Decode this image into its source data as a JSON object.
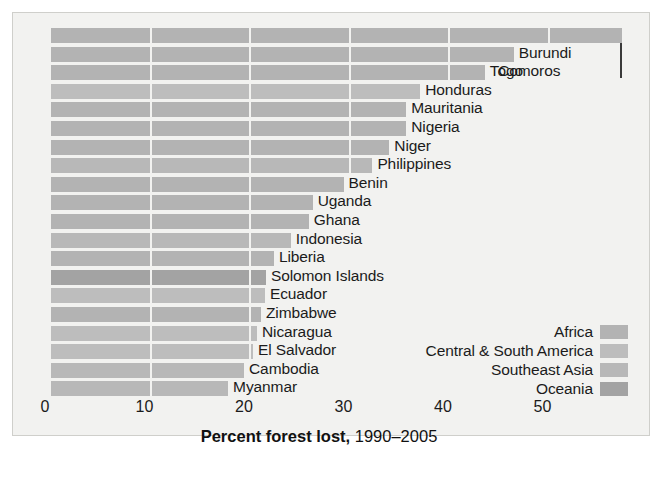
{
  "chart_data": {
    "type": "bar",
    "orientation": "horizontal",
    "title": "",
    "xlabel_bold": "Percent forest lost,",
    "xlabel_regular": " 1990–2005",
    "ylabel": "",
    "xlim": [
      0,
      58
    ],
    "xticks": [
      0,
      10,
      20,
      30,
      40,
      50
    ],
    "xtick_labels": [
      "0",
      "10",
      "20",
      "30",
      "40",
      "50"
    ],
    "grid": true,
    "legend_position": "inside-right",
    "categories": [
      "Comoros",
      "Burundi",
      "Togo",
      "Honduras",
      "Mauritania",
      "Nigeria",
      "Niger",
      "Philippines",
      "Benin",
      "Uganda",
      "Ghana",
      "Indonesia",
      "Liberia",
      "Solomon Islands",
      "Ecuador",
      "Zimbabwe",
      "Nicaragua",
      "El Salvador",
      "Cambodia",
      "Myanmar"
    ],
    "values": [
      57.4,
      46.5,
      43.6,
      37.1,
      35.7,
      35.7,
      34.0,
      32.3,
      29.4,
      26.3,
      25.9,
      24.1,
      22.4,
      21.6,
      21.5,
      21.1,
      20.7,
      20.3,
      19.4,
      17.8
    ],
    "regions": [
      "Africa",
      "Africa",
      "Africa",
      "Central & South America",
      "Africa",
      "Africa",
      "Africa",
      "Southeast Asia",
      "Africa",
      "Africa",
      "Africa",
      "Southeast Asia",
      "Africa",
      "Oceania",
      "Central & South America",
      "Africa",
      "Central & South America",
      "Central & South America",
      "Southeast Asia",
      "Southeast Asia"
    ],
    "legend": [
      {
        "label": "Africa",
        "color": "#b3b3b3"
      },
      {
        "label": "Central & South America",
        "color": "#bdbdbd"
      },
      {
        "label": "Southeast Asia",
        "color": "#b8b8b8"
      },
      {
        "label": "Oceania",
        "color": "#a3a3a3"
      }
    ],
    "colors": {
      "Africa": "#b3b3b3",
      "Central & South America": "#bdbdbd",
      "Southeast Asia": "#b8b8b8",
      "Oceania": "#a3a3a3"
    },
    "background": "#f2f2f0",
    "text_color": "#1b1b1b"
  }
}
